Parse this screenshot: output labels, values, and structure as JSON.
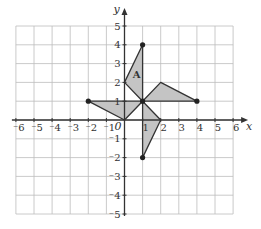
{
  "diagram": {
    "type": "coordinate-grid",
    "x_axis": {
      "label": "x",
      "min": -6,
      "max": 6,
      "ticks": [
        -6,
        -5,
        -4,
        -3,
        -2,
        -1,
        1,
        2,
        3,
        4,
        5,
        6
      ]
    },
    "y_axis": {
      "label": "y",
      "min": -5,
      "max": 5,
      "ticks": [
        -5,
        -4,
        -3,
        -2,
        -1,
        1,
        2,
        3,
        4,
        5
      ]
    },
    "origin_label": "0",
    "colors": {
      "grid": "#bdbdbd",
      "axis": "#333333",
      "fill": "#c4c4c4",
      "stroke": "#333333",
      "point": "#222222"
    },
    "shapes": [
      {
        "name": "A",
        "label": "A",
        "vertices": [
          [
            1,
            1
          ],
          [
            0,
            2
          ],
          [
            1,
            4
          ]
        ],
        "label_pos": [
          0.45,
          2.45
        ],
        "dot": [
          1,
          4
        ]
      },
      {
        "name": "right",
        "label": "",
        "vertices": [
          [
            1,
            1
          ],
          [
            2,
            2
          ],
          [
            4,
            1
          ]
        ],
        "dot": [
          4,
          1
        ]
      },
      {
        "name": "bottom",
        "label": "",
        "vertices": [
          [
            1,
            1
          ],
          [
            2,
            0
          ],
          [
            1,
            -2
          ]
        ],
        "dot": [
          1,
          -2
        ]
      },
      {
        "name": "left",
        "label": "",
        "vertices": [
          [
            1,
            1
          ],
          [
            -2,
            1
          ],
          [
            0,
            0
          ]
        ],
        "dot": [
          -2,
          1
        ]
      }
    ],
    "center_point": [
      1,
      1
    ]
  }
}
